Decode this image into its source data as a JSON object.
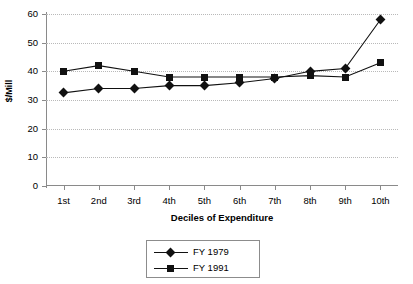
{
  "chart_data": {
    "type": "line",
    "title": "",
    "xlabel": "Deciles of Expenditure",
    "ylabel": "$/Mill",
    "categories": [
      "1st",
      "2nd",
      "3rd",
      "4th",
      "5th",
      "6th",
      "7th",
      "8th",
      "9th",
      "10th"
    ],
    "ylim": [
      0,
      60
    ],
    "yticks": [
      0,
      10,
      20,
      30,
      40,
      50,
      60
    ],
    "grid": "horizontal-dotted",
    "legend_position": "bottom",
    "series": [
      {
        "name": "FY 1979",
        "marker": "diamond",
        "color": "#111111",
        "values": [
          32.5,
          34.0,
          34.0,
          35.0,
          35.0,
          36.0,
          37.5,
          40.0,
          41.0,
          58.0
        ]
      },
      {
        "name": "FY 1991",
        "marker": "square",
        "color": "#111111",
        "values": [
          40.0,
          42.0,
          40.0,
          38.0,
          38.0,
          38.0,
          38.0,
          38.5,
          38.0,
          43.0
        ]
      }
    ]
  }
}
